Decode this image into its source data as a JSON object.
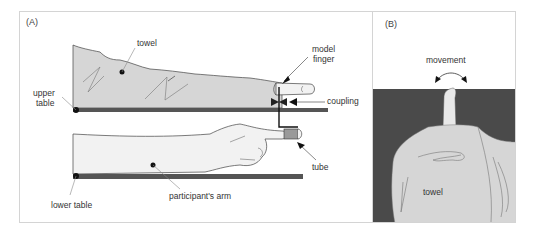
{
  "figure": {
    "panel_a": {
      "label": "(A)",
      "annotations": {
        "towel": "towel",
        "model_finger_line1": "model",
        "model_finger_line2": "finger",
        "coupling": "coupling",
        "upper_table_line1": "upper",
        "upper_table_line2": "table",
        "tube": "tube",
        "lower_table": "lower table",
        "participants_arm": "participant's arm"
      }
    },
    "panel_b": {
      "label": "(B)",
      "annotations": {
        "movement": "movement",
        "towel": "towel"
      }
    }
  },
  "colors": {
    "towel_fill": "#d6d6d6",
    "table_bar": "#555555",
    "panel_b_background": "#4a4a4a",
    "arm_fill": "#f2f2f2",
    "panel_border": "#d4d4d4"
  }
}
